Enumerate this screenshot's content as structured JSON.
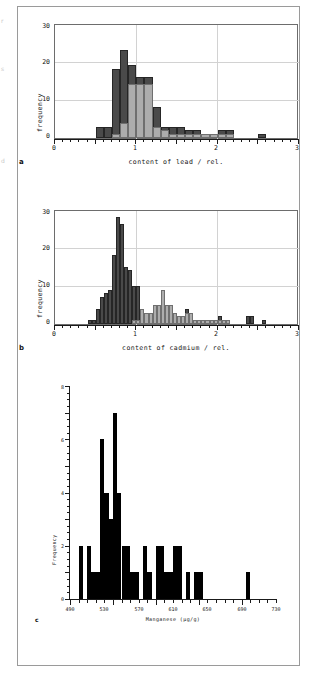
{
  "page": {
    "background": "#ffffff",
    "border_color": "#9a9a9a",
    "edge_marks": [
      "r",
      "s",
      "d"
    ]
  },
  "colors": {
    "series_dark": "#4a4a4a",
    "series_light": "#adadad",
    "solid_black": "#000000",
    "grid": "#d2d2d2",
    "axis": "#1a1a1a",
    "frame": "#6d6d6d"
  },
  "figures": [
    {
      "letter": "a",
      "ylabel": "frequency",
      "xlabel": "content of lead / rel.",
      "xticks": [
        "0",
        "1",
        "2",
        "3"
      ],
      "yticks": [
        "0",
        "10",
        "20",
        "30"
      ]
    },
    {
      "letter": "b",
      "ylabel": "frequency",
      "xlabel": "content of cadmium / rel.",
      "xticks": [
        "0",
        "1",
        "2",
        "3"
      ],
      "yticks": [
        "0",
        "10",
        "20",
        "30"
      ]
    },
    {
      "letter": "c",
      "ylabel": "Frequency",
      "xlabel": "Manganese (µg/g)",
      "xticks": [
        "490",
        "530",
        "570",
        "610",
        "650",
        "690",
        "730"
      ],
      "yticks": [
        "0",
        "2",
        "4",
        "6",
        "8"
      ]
    }
  ],
  "chart_data": [
    {
      "type": "bar",
      "id": "panel-a-lead",
      "title": "",
      "xlabel": "content of lead / rel.",
      "ylabel": "frequency",
      "xlim": [
        0,
        3
      ],
      "ylim": [
        0,
        30
      ],
      "xticks": [
        0,
        1,
        2,
        3
      ],
      "yticks": [
        0,
        10,
        20,
        30
      ],
      "grid": true,
      "legend": "none",
      "bin_width": 0.1,
      "series": [
        {
          "name": "dark group",
          "color": "#4a4a4a",
          "bin_starts": [
            0.5,
            0.6,
            0.7,
            0.8,
            0.9,
            1.0,
            1.1,
            1.2,
            1.3,
            1.4,
            1.5,
            1.6,
            1.7,
            1.8,
            1.9,
            2.0,
            2.1,
            2.5
          ],
          "values": [
            3,
            3,
            18,
            23,
            19,
            16,
            16,
            8,
            3,
            3,
            3,
            2,
            2,
            1,
            1,
            2,
            2,
            1
          ]
        },
        {
          "name": "light group",
          "color": "#adadad",
          "bin_starts": [
            0.7,
            0.8,
            0.9,
            1.0,
            1.1,
            1.2,
            1.3,
            1.4,
            1.5,
            1.6,
            1.7,
            1.8,
            1.9,
            2.0,
            2.1
          ],
          "values": [
            1,
            4,
            14,
            14,
            14,
            3,
            2,
            1,
            1,
            1,
            1,
            1,
            1,
            1,
            1
          ]
        }
      ]
    },
    {
      "type": "bar",
      "id": "panel-b-cadmium",
      "title": "",
      "xlabel": "content of cadmium / rel.",
      "ylabel": "frequency",
      "xlim": [
        0,
        3
      ],
      "ylim": [
        0,
        30
      ],
      "xticks": [
        0,
        1,
        2,
        3
      ],
      "yticks": [
        0,
        10,
        20,
        30
      ],
      "grid": true,
      "legend": "none",
      "bin_width": 0.05,
      "series": [
        {
          "name": "dark group",
          "color": "#4a4a4a",
          "bin_starts": [
            0.4,
            0.45,
            0.5,
            0.55,
            0.6,
            0.65,
            0.7,
            0.75,
            0.8,
            0.85,
            0.9,
            0.95,
            1.0,
            1.05,
            1.1,
            1.15,
            1.2,
            1.25,
            1.3,
            1.35,
            1.4,
            1.45,
            1.5,
            1.55,
            1.6,
            1.65,
            1.7,
            1.75,
            1.8,
            1.85,
            1.9,
            1.95,
            2.0,
            2.05,
            2.1,
            2.35,
            2.4,
            2.55
          ],
          "values": [
            1,
            1,
            4,
            7,
            8,
            9,
            18,
            28,
            26,
            15,
            14,
            10,
            10,
            4,
            3,
            3,
            5,
            5,
            9,
            5,
            5,
            3,
            2,
            2,
            4,
            3,
            1,
            1,
            1,
            1,
            1,
            1,
            2,
            1,
            1,
            2,
            2,
            1
          ]
        },
        {
          "name": "light group",
          "color": "#adadad",
          "bin_starts": [
            0.95,
            1.0,
            1.05,
            1.1,
            1.15,
            1.2,
            1.25,
            1.3,
            1.35,
            1.4,
            1.45,
            1.5,
            1.55,
            1.6,
            1.65,
            1.7,
            1.75,
            1.8,
            1.85,
            1.9,
            1.95,
            2.0,
            2.05,
            2.1
          ],
          "values": [
            1,
            1,
            4,
            3,
            3,
            5,
            5,
            9,
            5,
            5,
            3,
            2,
            2,
            3,
            3,
            1,
            1,
            1,
            1,
            1,
            1,
            1,
            1,
            1
          ]
        }
      ]
    },
    {
      "type": "bar",
      "id": "panel-c-manganese",
      "title": "",
      "xlabel": "Manganese (µg/g)",
      "ylabel": "Frequency",
      "xlim": [
        490,
        730
      ],
      "ylim": [
        0,
        8
      ],
      "xticks": [
        490,
        530,
        570,
        610,
        650,
        690,
        730
      ],
      "yticks": [
        0,
        2,
        4,
        6,
        8
      ],
      "grid": false,
      "legend": "none",
      "bin_width": 5,
      "color": "#000000",
      "bin_starts": [
        500,
        505,
        510,
        515,
        520,
        525,
        530,
        535,
        540,
        545,
        550,
        555,
        560,
        565,
        570,
        575,
        580,
        585,
        590,
        595,
        600,
        605,
        610,
        615,
        620,
        625,
        630,
        635,
        640,
        645,
        650,
        695
      ],
      "values": [
        2,
        0,
        2,
        1,
        1,
        6,
        4,
        3,
        7,
        4,
        2,
        2,
        1,
        1,
        0,
        2,
        1,
        0,
        2,
        2,
        1,
        1,
        2,
        2,
        0,
        1,
        0,
        1,
        1,
        0,
        0,
        1
      ]
    }
  ]
}
